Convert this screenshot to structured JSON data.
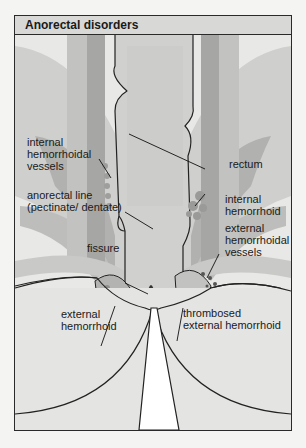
{
  "title": "Anorectal disorders",
  "labels": {
    "internal_hemorrhoidal_vessels": [
      "internal",
      "hemorrhoidal",
      "vessels"
    ],
    "rectum": "rectum",
    "anorectal_line": [
      "anorectal line",
      "(pectinate/ dentate)"
    ],
    "internal_hemorrhoid": [
      "internal",
      "hemorrhoid"
    ],
    "external_hemorrhoidal_vessels": [
      "external",
      "hemorrhoidal",
      "vessels"
    ],
    "fissure": "fissure",
    "external_hemorrhoid": [
      "external",
      "hemorrhoid"
    ],
    "thrombosed_external_hemorrhoid": [
      "thrombosed",
      "external hemorrhoid"
    ]
  },
  "colors": {
    "frame_border": "#2a2a2a",
    "title_bg": "#d8d8d6",
    "muscle_light": "#c9c9c7",
    "muscle_dark": "#a9a9a7",
    "rectum_fill": "#d2d2d0",
    "skin_fill": "#e4e4e2"
  }
}
